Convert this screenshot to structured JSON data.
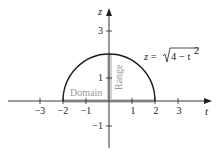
{
  "diagram": {
    "type": "function-graph",
    "axes": {
      "horizontal_label": "t",
      "vertical_label": "z",
      "x_ticks": [
        {
          "value": -3,
          "label": "−3"
        },
        {
          "value": -2,
          "label": "−2"
        },
        {
          "value": -1,
          "label": "−1"
        },
        {
          "value": 1,
          "label": "1"
        },
        {
          "value": 2,
          "label": "2"
        },
        {
          "value": 3,
          "label": "3"
        }
      ],
      "y_ticks": [
        {
          "value": 3,
          "label": "3"
        },
        {
          "value": 1,
          "label": "1"
        },
        {
          "value": -1,
          "label": "−1"
        }
      ]
    },
    "curve": {
      "equation_lhs": "z = ",
      "equation_radical": "4 − t",
      "equation_exponent": "2",
      "domain": [
        -2,
        2
      ],
      "range": [
        0,
        2
      ]
    },
    "regions": {
      "domain_label": "Domain",
      "range_label": "Range"
    },
    "colors": {
      "curve": "#1a1a1a",
      "axis": "#222222",
      "highlight": "#cccccc",
      "region_text": "#999999"
    }
  }
}
